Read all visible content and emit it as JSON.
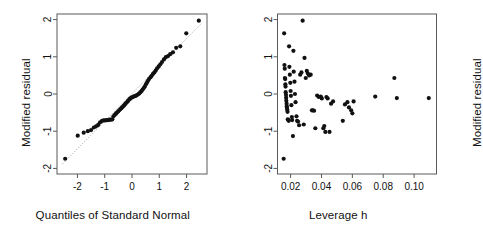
{
  "figure": {
    "type": "diagnostic-plot-pair",
    "background": "#ffffff",
    "point_color": "#111111",
    "frame_color": "#5a5a5a",
    "reference_line_color": "#9a9a9a"
  },
  "panels": [
    {
      "id": "qq-plot",
      "ylabel": "Modified residual",
      "xlabel": "Quantiles of Standard Normal",
      "xticks": [
        "-2",
        "-1",
        "0",
        "1",
        "2"
      ],
      "yticks": [
        "-2",
        "-1",
        "0",
        "1",
        "2"
      ]
    },
    {
      "id": "leverage-plot",
      "ylabel": "Modified residual",
      "xlabel": "Leverage h",
      "xticks": [
        "0.02",
        "0.04",
        "0.06",
        "0.08",
        "0.10"
      ],
      "yticks": [
        "-2",
        "-1",
        "0",
        "1",
        "2"
      ]
    }
  ],
  "chart_data": [
    {
      "type": "scatter",
      "id": "qq-plot",
      "title": "",
      "xlabel": "Quantiles of Standard Normal",
      "ylabel": "Modified residual",
      "xlim": [
        -2.75,
        2.75
      ],
      "ylim": [
        -2.15,
        2.15
      ],
      "xticks": [
        -2,
        -1,
        0,
        1,
        2
      ],
      "yticks": [
        -2,
        -1,
        0,
        1,
        2
      ],
      "grid": false,
      "legend": "none",
      "annotations": [
        "dotted reference line through quantile pairs"
      ],
      "reference_line": {
        "x": [
          -2.55,
          2.55
        ],
        "y": [
          -1.88,
          1.9
        ],
        "style": "dotted"
      },
      "x": [
        -2.45,
        -1.99,
        -1.77,
        -1.62,
        -1.5,
        -1.4,
        -1.32,
        -1.24,
        -1.17,
        -1.1,
        -1.04,
        -0.98,
        -0.92,
        -0.87,
        -0.82,
        -0.77,
        -0.72,
        -0.68,
        -0.63,
        -0.59,
        -0.55,
        -0.51,
        -0.47,
        -0.43,
        -0.39,
        -0.35,
        -0.31,
        -0.27,
        -0.24,
        -0.2,
        -0.16,
        -0.13,
        -0.09,
        -0.06,
        -0.02,
        0.02,
        0.06,
        0.09,
        0.13,
        0.16,
        0.2,
        0.24,
        0.27,
        0.31,
        0.35,
        0.39,
        0.43,
        0.47,
        0.51,
        0.55,
        0.59,
        0.63,
        0.68,
        0.72,
        0.77,
        0.82,
        0.87,
        0.92,
        0.98,
        1.04,
        1.1,
        1.17,
        1.24,
        1.32,
        1.4,
        1.5,
        1.62,
        1.77,
        1.99,
        2.45
      ],
      "y": [
        -1.74,
        -1.12,
        -1.04,
        -1.0,
        -0.97,
        -0.9,
        -0.87,
        -0.83,
        -0.76,
        -0.72,
        -0.71,
        -0.71,
        -0.7,
        -0.7,
        -0.69,
        -0.69,
        -0.68,
        -0.6,
        -0.56,
        -0.53,
        -0.5,
        -0.47,
        -0.44,
        -0.41,
        -0.38,
        -0.35,
        -0.32,
        -0.29,
        -0.26,
        -0.23,
        -0.2,
        -0.17,
        -0.14,
        -0.12,
        -0.1,
        -0.08,
        -0.07,
        -0.06,
        -0.05,
        -0.04,
        -0.02,
        0.0,
        0.02,
        0.05,
        0.08,
        0.12,
        0.16,
        0.2,
        0.26,
        0.31,
        0.36,
        0.41,
        0.45,
        0.49,
        0.54,
        0.58,
        0.63,
        0.69,
        0.74,
        0.8,
        0.86,
        0.93,
        0.99,
        1.02,
        1.07,
        1.12,
        1.24,
        1.28,
        1.63,
        1.97
      ]
    },
    {
      "type": "scatter",
      "id": "leverage-plot",
      "title": "",
      "xlabel": "Leverage h",
      "ylabel": "Modified residual",
      "xlim": [
        0.0115,
        0.1145
      ],
      "ylim": [
        -2.15,
        2.15
      ],
      "xticks": [
        0.02,
        0.04,
        0.06,
        0.08,
        0.1
      ],
      "yticks": [
        -2,
        -1,
        0,
        1,
        2
      ],
      "grid": false,
      "legend": "none",
      "x": [
        0.0155,
        0.0158,
        0.016,
        0.0162,
        0.0163,
        0.0165,
        0.0166,
        0.0167,
        0.0168,
        0.017,
        0.0171,
        0.0172,
        0.0174,
        0.0175,
        0.0176,
        0.0178,
        0.018,
        0.0182,
        0.0185,
        0.0188,
        0.019,
        0.0192,
        0.0195,
        0.0198,
        0.02,
        0.0202,
        0.0205,
        0.0208,
        0.021,
        0.0215,
        0.0218,
        0.022,
        0.0225,
        0.0228,
        0.0232,
        0.0238,
        0.0242,
        0.0248,
        0.0255,
        0.0262,
        0.027,
        0.0278,
        0.0285,
        0.029,
        0.0298,
        0.0305,
        0.0312,
        0.032,
        0.033,
        0.0338,
        0.0345,
        0.0352,
        0.036,
        0.0372,
        0.0382,
        0.0395,
        0.0402,
        0.0412,
        0.0418,
        0.0425,
        0.0432,
        0.044,
        0.0452,
        0.0462,
        0.0475,
        0.0538,
        0.0552,
        0.0568,
        0.0578,
        0.0592,
        0.06,
        0.0608,
        0.0748,
        0.0872,
        0.0888,
        0.1095
      ],
      "y": [
        -1.74,
        1.63,
        0.78,
        0.68,
        0.43,
        0.4,
        0.26,
        0.2,
        0.05,
        -0.02,
        -0.1,
        -0.18,
        -0.26,
        -0.33,
        -0.37,
        -0.42,
        -0.48,
        -0.68,
        -0.7,
        -0.72,
        1.28,
        0.73,
        0.52,
        0.3,
        0.08,
        -0.05,
        -0.3,
        -0.62,
        -0.7,
        -1.13,
        1.16,
        0.6,
        0.33,
        0.0,
        -0.22,
        -0.6,
        -0.72,
        -0.74,
        -0.84,
        0.52,
        0.58,
        1.97,
        -0.82,
        0.97,
        0.43,
        0.62,
        0.55,
        0.5,
        0.52,
        -0.44,
        -0.44,
        -0.45,
        -0.92,
        -0.04,
        -0.08,
        -0.07,
        -0.12,
        -0.92,
        -0.86,
        -1.02,
        -0.08,
        -0.12,
        -1.02,
        -0.26,
        -0.2,
        -0.72,
        -0.28,
        -0.22,
        -0.36,
        -0.44,
        -0.52,
        -0.2,
        -0.07,
        0.43,
        -0.11,
        -0.11
      ]
    }
  ]
}
